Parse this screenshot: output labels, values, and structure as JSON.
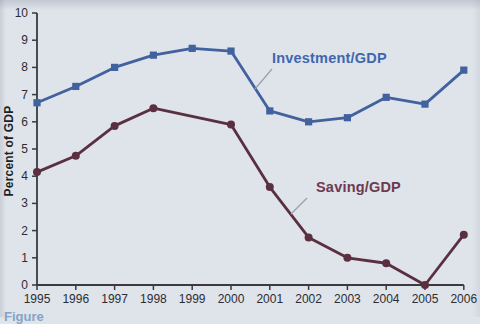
{
  "figure": {
    "caption_partial": "Figure",
    "colors": {
      "background": "#dfe3ea",
      "axis": "#3a3a40",
      "tick_text": "#2c2d33",
      "investment_blue": "#42619f",
      "saving_maroon": "#5a3040",
      "leader_line": "#98a0ad",
      "caption_blue": "#3a6fb0"
    }
  },
  "chart_data": {
    "type": "line",
    "title": "",
    "xlabel": "",
    "ylabel": "Percent of GDP",
    "x": [
      1995,
      1996,
      1997,
      1998,
      1999,
      2000,
      2001,
      2002,
      2003,
      2004,
      2005,
      2006
    ],
    "ylim": [
      0,
      10
    ],
    "yticks": [
      0,
      1,
      2,
      3,
      4,
      5,
      6,
      7,
      8,
      9,
      10
    ],
    "grid": false,
    "legend": "inline annotations with leader lines",
    "series": [
      {
        "name": "Investment/GDP",
        "color": "#42619f",
        "marker": "square",
        "values": [
          6.7,
          7.3,
          8.0,
          8.45,
          8.7,
          8.6,
          6.4,
          6.0,
          6.15,
          6.9,
          6.65,
          7.9
        ]
      },
      {
        "name": "Saving/GDP",
        "color": "#5a3040",
        "marker": "circle",
        "values": [
          4.15,
          4.75,
          5.85,
          6.5,
          6.2,
          5.9,
          3.6,
          1.75,
          1.0,
          0.8,
          0.0,
          1.85
        ],
        "no_marker_years": [
          1999
        ]
      }
    ]
  }
}
